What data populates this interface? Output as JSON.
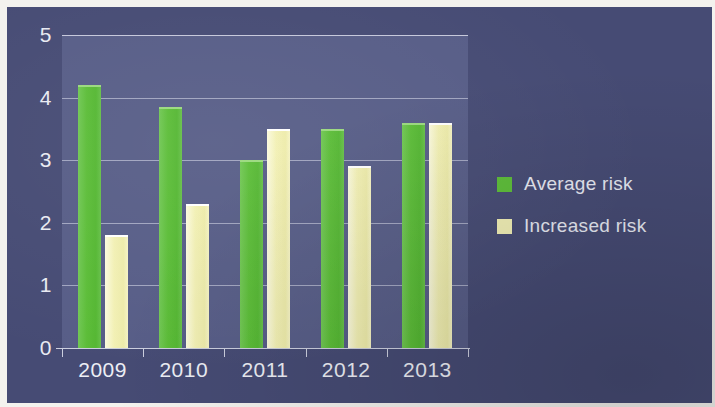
{
  "chart_data": {
    "type": "bar",
    "title": "",
    "subtitle": "",
    "xlabel": "",
    "ylabel": "",
    "categories": [
      "2009",
      "2010",
      "2011",
      "2012",
      "2013"
    ],
    "series": [
      {
        "name": "Average risk",
        "color": "#5cbd38",
        "values": [
          4.2,
          3.85,
          3.0,
          3.5,
          3.6
        ]
      },
      {
        "name": "Increased risk",
        "color": "#f1efb5",
        "values": [
          1.8,
          2.3,
          3.5,
          2.9,
          3.6
        ]
      }
    ],
    "ylim": [
      0,
      5
    ],
    "yticks": [
      "5",
      "4",
      "3",
      "2",
      "1",
      "0"
    ],
    "ytick_values": [
      5,
      4,
      3,
      2,
      1,
      0
    ],
    "grid": true,
    "grid_axis": "y",
    "legend_position": "right",
    "annotations": []
  },
  "legend": {
    "items": [
      {
        "label": "Average risk",
        "swatch": "average"
      },
      {
        "label": "Increased risk",
        "swatch": "increased"
      }
    ]
  },
  "colors": {
    "background": "#464b74",
    "plot_background": "#575d87",
    "average_risk": "#5cbd38",
    "increased_risk": "#f1efb5",
    "text": "#e9eaf2",
    "gridline": "#dee0ee"
  }
}
